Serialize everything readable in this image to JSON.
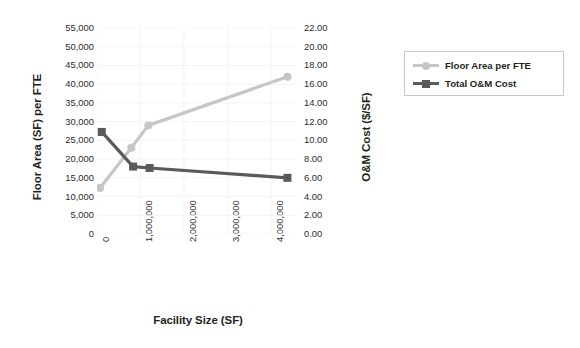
{
  "chart_data": {
    "type": "line",
    "title": "",
    "xlabel": "Facility Size (SF)",
    "ylabel": "Floor Area (SF) per FTE",
    "y2label": "O&M Cost ($/SF)",
    "xlim": [
      0,
      4600000
    ],
    "ylim": [
      0,
      55000
    ],
    "y2lim": [
      0,
      22.0
    ],
    "grid": true,
    "legend_position": "right",
    "xticks": [
      0,
      1000000,
      2000000,
      3000000,
      4000000
    ],
    "xticklabels": [
      "0",
      "1,000,000",
      "2,000,000",
      "3,000,000",
      "4,000,000"
    ],
    "yticks": [
      0,
      5000,
      10000,
      15000,
      20000,
      25000,
      30000,
      35000,
      40000,
      45000,
      50000,
      55000
    ],
    "yticklabels": [
      "0",
      "5,000",
      "10,000",
      "15,000",
      "20,000",
      "25,000",
      "30,000",
      "35,000",
      "40,000",
      "45,000",
      "50,000",
      "55,000"
    ],
    "y2ticks": [
      0,
      2,
      4,
      6,
      8,
      10,
      12,
      14,
      16,
      18,
      20,
      22
    ],
    "y2ticklabels": [
      "0.00",
      "2.00",
      "4.00",
      "6.00",
      "8.00",
      "10.00",
      "12.00",
      "14.00",
      "16.00",
      "18.00",
      "20.00",
      "22.00"
    ],
    "series": [
      {
        "name": "Floor Area per FTE",
        "axis": "left",
        "color": "#c6c6c6",
        "marker": "circle",
        "x": [
          70000,
          790000,
          1180000,
          4380000
        ],
        "values": [
          12300,
          23000,
          29000,
          42000
        ]
      },
      {
        "name": "Total O&M Cost",
        "axis": "right",
        "color": "#5a5a5a",
        "marker": "square",
        "x": [
          110000,
          830000,
          1210000,
          4380000
        ],
        "values": [
          10.9,
          7.2,
          7.05,
          6.0
        ]
      }
    ],
    "legend": [
      {
        "label": "Floor Area per FTE",
        "color": "#c6c6c6",
        "marker": "circle"
      },
      {
        "label": "Total O&M Cost",
        "color": "#5a5a5a",
        "marker": "square"
      }
    ]
  }
}
